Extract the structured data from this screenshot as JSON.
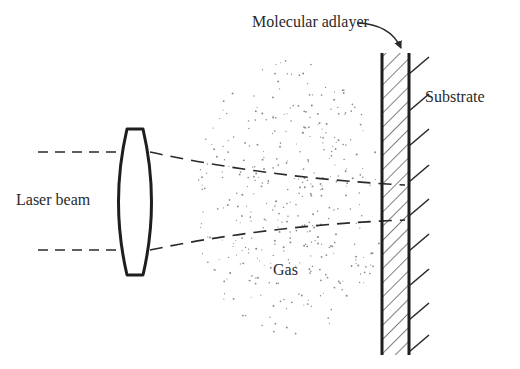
{
  "figure": {
    "labels": {
      "adlayer": "Molecular adlayer",
      "substrate": "Substrate",
      "laser": "Laser beam",
      "gas": "Gas"
    },
    "colors": {
      "ink": "#2a2a2a",
      "background": "#ffffff",
      "dots": "#8a8a8a"
    },
    "components": [
      {
        "name": "laser-beam",
        "style": "dashed",
        "count": 2
      },
      {
        "name": "lens",
        "shape": "biconvex"
      },
      {
        "name": "gas-region",
        "style": "stippled"
      },
      {
        "name": "molecular-adlayer",
        "style": "hatched"
      },
      {
        "name": "substrate",
        "style": "tick-marked surface"
      }
    ]
  }
}
